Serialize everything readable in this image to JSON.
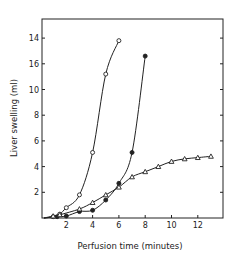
{
  "chart_data": {
    "type": "line",
    "title": "",
    "xlabel": "Perfusion time (minutes)",
    "ylabel": "Liver swelling (ml)",
    "xlim": [
      0,
      14
    ],
    "ylim": [
      0,
      15
    ],
    "x_ticks": [
      2,
      4,
      6,
      8,
      10,
      12
    ],
    "y_ticks": [
      2,
      4,
      6,
      8,
      10,
      12,
      14
    ],
    "y_tick_labels": [
      "2",
      "4",
      "6",
      "8",
      "10",
      "16",
      "14"
    ],
    "grid": false,
    "legend": null,
    "series": [
      {
        "name": "open-circles",
        "marker": "open-circle",
        "x": [
          1,
          1.5,
          2,
          3,
          4,
          5,
          6
        ],
        "y": [
          0.1,
          0.3,
          0.8,
          1.8,
          5.1,
          11.2,
          13.8
        ]
      },
      {
        "name": "filled-circles",
        "marker": "filled-circle",
        "x": [
          1.3,
          2,
          3,
          4,
          5,
          6,
          7,
          8
        ],
        "y": [
          0.1,
          0.15,
          0.5,
          0.6,
          1.4,
          2.7,
          5.1,
          12.6
        ]
      },
      {
        "name": "open-triangles",
        "marker": "open-triangle",
        "x": [
          1,
          1.5,
          3,
          4,
          5,
          6,
          7,
          8,
          9,
          10,
          11,
          12,
          13
        ],
        "y": [
          0.15,
          0.25,
          0.7,
          1.2,
          1.8,
          2.4,
          3.2,
          3.6,
          4.0,
          4.4,
          4.6,
          4.7,
          4.8
        ]
      }
    ]
  }
}
